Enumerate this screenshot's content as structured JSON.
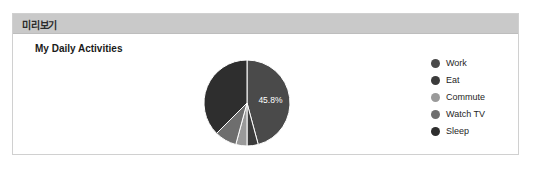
{
  "panel": {
    "header_title": "미리보기",
    "header_bg": "#c9c9c9",
    "border_color": "#d0d0d0"
  },
  "chart_data": {
    "type": "pie",
    "title": "My Daily Activities",
    "xlabel": "",
    "ylabel": "",
    "legend_position": "right",
    "grid": false,
    "categories": [
      "Work",
      "Eat",
      "Commute",
      "Watch TV",
      "Sleep"
    ],
    "values": [
      45.8,
      4.2,
      4.2,
      8.3,
      37.5
    ],
    "labels": [
      "45.8%",
      "",
      "",
      "",
      ""
    ],
    "visible_data_labels": [
      "45.8%"
    ],
    "colors": [
      "#4a4a4a",
      "#3b3b3b",
      "#9a9a9a",
      "#6e6e6e",
      "#2e2e2e"
    ],
    "slices": [
      {
        "name": "Work",
        "value": 45.8,
        "color": "#4a4a4a",
        "label": "45.8%"
      },
      {
        "name": "Eat",
        "value": 4.2,
        "color": "#3b3b3b",
        "label": ""
      },
      {
        "name": "Commute",
        "value": 4.2,
        "color": "#9a9a9a",
        "label": ""
      },
      {
        "name": "Watch TV",
        "value": 8.3,
        "color": "#6e6e6e",
        "label": ""
      },
      {
        "name": "Sleep",
        "value": 37.5,
        "color": "#2e2e2e",
        "label": ""
      }
    ]
  },
  "legend": {
    "items": [
      {
        "label": "Work",
        "color": "#4a4a4a"
      },
      {
        "label": "Eat",
        "color": "#3b3b3b"
      },
      {
        "label": "Commute",
        "color": "#9a9a9a"
      },
      {
        "label": "Watch TV",
        "color": "#6e6e6e"
      },
      {
        "label": "Sleep",
        "color": "#2e2e2e"
      }
    ]
  }
}
